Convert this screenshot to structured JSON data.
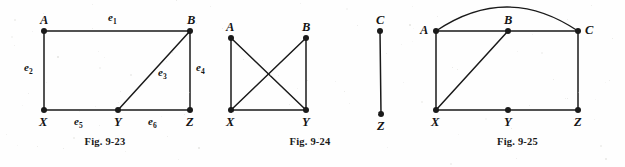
{
  "page": {
    "background_color": "#fefefe",
    "ink_color": "#1a1a1a",
    "width": 625,
    "height": 167
  },
  "figures": [
    {
      "id": "fig-9-23",
      "caption": "Fig. 9-23",
      "vertices": [
        {
          "name": "A",
          "x": 44,
          "y": 31,
          "label_dx": -4,
          "label_dy": -17
        },
        {
          "name": "B",
          "x": 190,
          "y": 31,
          "label_dx": -3,
          "label_dy": -17
        },
        {
          "name": "X",
          "x": 44,
          "y": 110,
          "label_dx": -5,
          "label_dy": 6
        },
        {
          "name": "Y",
          "x": 118,
          "y": 110,
          "label_dx": -4,
          "label_dy": 6
        },
        {
          "name": "Z",
          "x": 190,
          "y": 110,
          "label_dx": -4,
          "label_dy": 6
        }
      ],
      "edges": [
        {
          "name": "e1",
          "from": "A",
          "to": "B"
        },
        {
          "name": "e2",
          "from": "A",
          "to": "X"
        },
        {
          "name": "e3",
          "from": "Y",
          "to": "B"
        },
        {
          "name": "e4",
          "from": "B",
          "to": "Z"
        },
        {
          "name": "e5",
          "from": "X",
          "to": "Y"
        },
        {
          "name": "e6",
          "from": "Y",
          "to": "Z"
        }
      ],
      "edge_labels": [
        {
          "text": "e",
          "sub": "1",
          "x": 108,
          "y": 12
        },
        {
          "text": "e",
          "sub": "2",
          "x": 24,
          "y": 62
        },
        {
          "text": "e",
          "sub": "3",
          "x": 158,
          "y": 67
        },
        {
          "text": "e",
          "sub": "4",
          "x": 196,
          "y": 62
        },
        {
          "text": "e",
          "sub": "5",
          "x": 74,
          "y": 116
        },
        {
          "text": "e",
          "sub": "6",
          "x": 148,
          "y": 116
        }
      ],
      "arcs": []
    },
    {
      "id": "fig-9-24",
      "caption": "Fig. 9-24",
      "vertices": [
        {
          "name": "A",
          "x": 21,
          "y": 38,
          "label_dx": -5,
          "label_dy": -17
        },
        {
          "name": "B",
          "x": 96,
          "y": 38,
          "label_dx": -4,
          "label_dy": -17
        },
        {
          "name": "C",
          "x": 170,
          "y": 31,
          "label_dx": -4,
          "label_dy": -17
        },
        {
          "name": "X",
          "x": 21,
          "y": 110,
          "label_dx": -5,
          "label_dy": 6
        },
        {
          "name": "Y",
          "x": 96,
          "y": 110,
          "label_dx": -4,
          "label_dy": 6
        },
        {
          "name": "Z",
          "x": 171,
          "y": 114,
          "label_dx": -4,
          "label_dy": 6
        }
      ],
      "edges": [
        {
          "name": "AX",
          "from": "A",
          "to": "X"
        },
        {
          "name": "AY",
          "from": "A",
          "to": "Y"
        },
        {
          "name": "BX",
          "from": "B",
          "to": "X"
        },
        {
          "name": "BY",
          "from": "B",
          "to": "Y"
        },
        {
          "name": "XY",
          "from": "X",
          "to": "Y"
        },
        {
          "name": "CZ",
          "from": "C",
          "to": "Z"
        }
      ],
      "edge_labels": [],
      "arcs": []
    },
    {
      "id": "fig-9-25",
      "caption": "Fig. 9-25",
      "vertices": [
        {
          "name": "A",
          "x": 26,
          "y": 31,
          "label_dx": -16,
          "label_dy": -7
        },
        {
          "name": "B",
          "x": 98,
          "y": 31,
          "label_dx": -4,
          "label_dy": -17
        },
        {
          "name": "C",
          "x": 168,
          "y": 31,
          "label_dx": 7,
          "label_dy": -7
        },
        {
          "name": "X",
          "x": 26,
          "y": 110,
          "label_dx": -5,
          "label_dy": 6
        },
        {
          "name": "Y",
          "x": 98,
          "y": 110,
          "label_dx": -4,
          "label_dy": 6
        },
        {
          "name": "Z",
          "x": 168,
          "y": 110,
          "label_dx": -4,
          "label_dy": 6
        }
      ],
      "edges": [
        {
          "name": "AB",
          "from": "A",
          "to": "B"
        },
        {
          "name": "BC",
          "from": "B",
          "to": "C"
        },
        {
          "name": "AX",
          "from": "A",
          "to": "X"
        },
        {
          "name": "CZ",
          "from": "C",
          "to": "Z"
        },
        {
          "name": "XY",
          "from": "X",
          "to": "Y"
        },
        {
          "name": "YZ",
          "from": "Y",
          "to": "Z"
        },
        {
          "name": "XB",
          "from": "X",
          "to": "B"
        }
      ],
      "edge_labels": [],
      "arcs": [
        {
          "name": "arc-A-C",
          "from": "A",
          "to": "C",
          "peak_y": 7
        }
      ]
    }
  ]
}
